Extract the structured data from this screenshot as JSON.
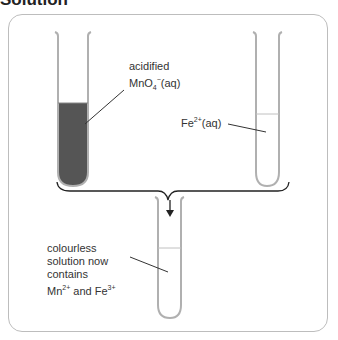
{
  "heading": "Solution",
  "tubes": {
    "left": {
      "label_line1": "acidified",
      "label_line2_main": "MnO",
      "label_line2_sub": "4",
      "label_line2_sup": "−",
      "label_line2_tail": "(aq)",
      "fill_color": "#555555"
    },
    "right": {
      "label_main": "Fe",
      "label_sup": "2+",
      "label_tail": "(aq)"
    },
    "bottom": {
      "line1": "colourless",
      "line2": "solution now",
      "line3": "contains",
      "line4_a": "Mn",
      "line4_a_sup": "2+",
      "line4_mid": " and Fe",
      "line4_b_sup": "3+"
    }
  },
  "colors": {
    "tube_stroke": "#b0b0b0",
    "frame": "#bdbdbd",
    "liquid": "#555555"
  }
}
